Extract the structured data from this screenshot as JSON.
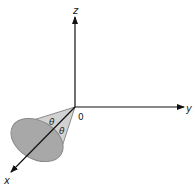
{
  "diagram": {
    "type": "3d-coordinate-cone",
    "axes": {
      "z_label": "z",
      "y_label": "y",
      "x_label": "x",
      "origin_label": "0"
    },
    "angle_labels": [
      "θ",
      "θ"
    ],
    "colors": {
      "cone_side": "#d2d2d2",
      "cone_base": "#a8a8a8",
      "cone_outline": "#8a8a8a",
      "axis": "#111111"
    }
  }
}
